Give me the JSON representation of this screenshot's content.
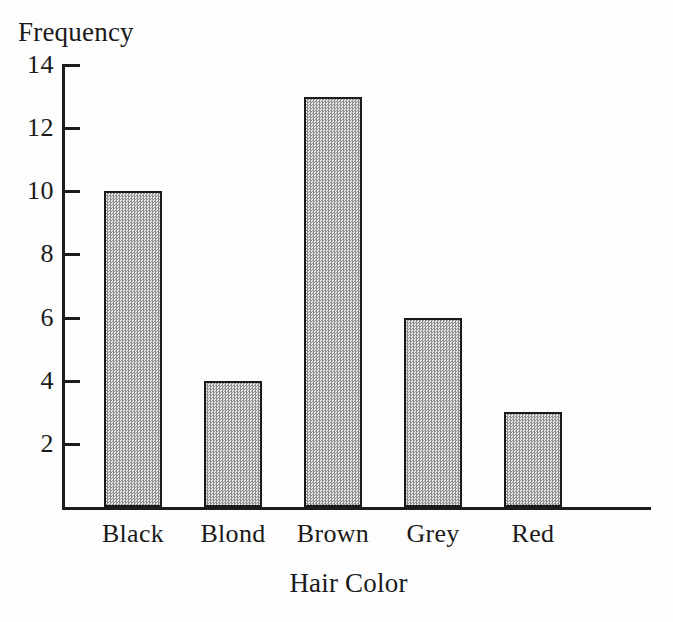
{
  "chart_data": {
    "type": "bar",
    "title": "",
    "xlabel": "Hair Color",
    "ylabel": "Frequency",
    "categories": [
      "Black",
      "Blond",
      "Brown",
      "Grey",
      "Red"
    ],
    "values": [
      10,
      4,
      13,
      6,
      3
    ],
    "ylim": [
      0,
      14
    ],
    "ytick_labels": [
      "2",
      "4",
      "6",
      "8",
      "10",
      "12",
      "14"
    ],
    "ytick_values": [
      2,
      4,
      6,
      8,
      10,
      12,
      14
    ],
    "grid": false,
    "legend": "none",
    "bar_fill_color": "#c8c8c8",
    "bar_edge_color": "#1a1a1a",
    "axis_color": "#1c1c1c",
    "background_color": "#fdfdfd"
  }
}
